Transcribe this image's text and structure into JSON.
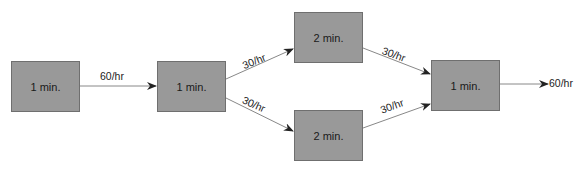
{
  "diagram": {
    "type": "process-flow",
    "colors": {
      "box_fill": "#999999",
      "box_border": "#6f6f6f",
      "line": "#777777",
      "arrowhead": "#222222"
    },
    "nodes": [
      {
        "id": "a",
        "label": "1 min."
      },
      {
        "id": "b",
        "label": "1 min."
      },
      {
        "id": "c",
        "label": "2 min."
      },
      {
        "id": "d",
        "label": "2 min."
      },
      {
        "id": "e",
        "label": "1 min."
      }
    ],
    "edges": [
      {
        "from": "a",
        "to": "b",
        "label": "60/hr"
      },
      {
        "from": "b",
        "to": "c",
        "label": "30/hr"
      },
      {
        "from": "b",
        "to": "d",
        "label": "30/hr"
      },
      {
        "from": "c",
        "to": "e",
        "label": "30/hr"
      },
      {
        "from": "d",
        "to": "e",
        "label": "30/hr"
      },
      {
        "from": "e",
        "to": "output",
        "label": "60/hr"
      }
    ]
  }
}
